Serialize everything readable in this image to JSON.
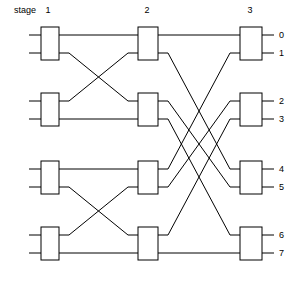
{
  "header": {
    "stage_label": "stage",
    "stage_numbers": [
      "1",
      "2",
      "3"
    ]
  },
  "outputs": {
    "labels": [
      "0",
      "1",
      "2",
      "3",
      "4",
      "5",
      "6",
      "7"
    ]
  },
  "colors": {
    "line": "#000000",
    "box_fill": "#ffffff",
    "background": "#ffffff"
  },
  "chart_data": {
    "type": "diagram",
    "title": "stage",
    "stages": 3,
    "switches_per_stage": 4,
    "switch_ports": 2,
    "network_size": 8,
    "stage_geometry": [
      {
        "stage": 1,
        "x": 41,
        "width": 18
      },
      {
        "stage": 2,
        "x": 138,
        "width": 20
      },
      {
        "stage": 3,
        "x": 240,
        "width": 22
      }
    ],
    "switch_rows_y": [
      {
        "row": 0,
        "top": 27,
        "bottom": 60,
        "port_top_y": 35,
        "port_bottom_y": 53
      },
      {
        "row": 1,
        "top": 93,
        "bottom": 126,
        "port_top_y": 101,
        "port_bottom_y": 119
      },
      {
        "row": 2,
        "top": 161,
        "bottom": 194,
        "port_top_y": 169,
        "port_bottom_y": 187
      },
      {
        "row": 3,
        "top": 227,
        "bottom": 260,
        "port_top_y": 235,
        "port_bottom_y": 253
      }
    ],
    "links_stage1_to_stage2": [
      {
        "from_switch": 0,
        "from_port": 0,
        "to_switch": 0,
        "to_port": 0
      },
      {
        "from_switch": 0,
        "from_port": 1,
        "to_switch": 1,
        "to_port": 0
      },
      {
        "from_switch": 1,
        "from_port": 0,
        "to_switch": 0,
        "to_port": 1
      },
      {
        "from_switch": 1,
        "from_port": 1,
        "to_switch": 1,
        "to_port": 1
      },
      {
        "from_switch": 2,
        "from_port": 0,
        "to_switch": 2,
        "to_port": 0
      },
      {
        "from_switch": 2,
        "from_port": 1,
        "to_switch": 3,
        "to_port": 0
      },
      {
        "from_switch": 3,
        "from_port": 0,
        "to_switch": 2,
        "to_port": 1
      },
      {
        "from_switch": 3,
        "from_port": 1,
        "to_switch": 3,
        "to_port": 1
      }
    ],
    "links_stage2_to_stage3": [
      {
        "from_switch": 0,
        "from_port": 0,
        "to_switch": 0,
        "to_port": 0
      },
      {
        "from_switch": 0,
        "from_port": 1,
        "to_switch": 2,
        "to_port": 0
      },
      {
        "from_switch": 1,
        "from_port": 0,
        "to_switch": 2,
        "to_port": 1
      },
      {
        "from_switch": 1,
        "from_port": 1,
        "to_switch": 3,
        "to_port": 0
      },
      {
        "from_switch": 2,
        "from_port": 0,
        "to_switch": 0,
        "to_port": 1
      },
      {
        "from_switch": 2,
        "from_port": 1,
        "to_switch": 1,
        "to_port": 0
      },
      {
        "from_switch": 3,
        "from_port": 0,
        "to_switch": 1,
        "to_port": 1
      },
      {
        "from_switch": 3,
        "from_port": 1,
        "to_switch": 3,
        "to_port": 1
      }
    ],
    "input_stubs": [
      {
        "switch": 0,
        "port": 0,
        "y": 35
      },
      {
        "switch": 0,
        "port": 1,
        "y": 53
      },
      {
        "switch": 1,
        "port": 0,
        "y": 101
      },
      {
        "switch": 1,
        "port": 1,
        "y": 119
      },
      {
        "switch": 2,
        "port": 0,
        "y": 169
      },
      {
        "switch": 2,
        "port": 1,
        "y": 187
      },
      {
        "switch": 3,
        "port": 0,
        "y": 235
      },
      {
        "switch": 3,
        "port": 1,
        "y": 253
      }
    ],
    "output_stubs": [
      {
        "label": "0",
        "y": 35
      },
      {
        "label": "1",
        "y": 53
      },
      {
        "label": "2",
        "y": 101
      },
      {
        "label": "3",
        "y": 119
      },
      {
        "label": "4",
        "y": 169
      },
      {
        "label": "5",
        "y": 187
      },
      {
        "label": "6",
        "y": 235
      },
      {
        "label": "7",
        "y": 253
      }
    ]
  }
}
